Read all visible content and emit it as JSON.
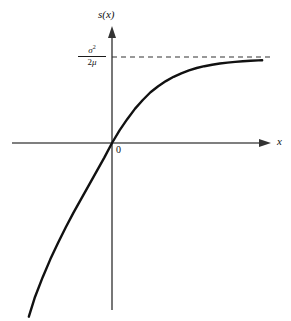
{
  "chart_data": {
    "type": "line",
    "title": "",
    "subtitle": "",
    "xlabel": "x",
    "ylabel": "s(x)",
    "origin_label": "0",
    "grid": false,
    "legend": null,
    "xlim": [
      -1.1,
      2.05
    ],
    "ylim": [
      -2.05,
      1.18
    ],
    "axes": {
      "x_axis_y_value": 0,
      "y_axis_x_value": 0,
      "x_arrow": true,
      "y_arrow": true,
      "x_axis_start": -1.1,
      "x_axis_end": 2.0,
      "y_axis_bottom": -1.95,
      "y_axis_top": 1.15
    },
    "annotations": [
      {
        "name": "asymptote-label",
        "numerator": "σ",
        "numerator_exponent": "2",
        "denominator_coefficient": "2",
        "denominator_symbol": "μ",
        "text": "σ²/2μ",
        "y_value": 1.0
      }
    ],
    "asymptote": {
      "type": "horizontal-dashed",
      "y_value": 1.0,
      "x_from": 0,
      "x_to": 2.05,
      "dash_pattern": "5,4",
      "color": "#333333"
    },
    "series": [
      {
        "name": "s(x)",
        "color": "#111111",
        "line_width": 2.4,
        "dashed": false,
        "x": [
          -1.08,
          -1.0,
          -0.9,
          -0.8,
          -0.7,
          -0.6,
          -0.5,
          -0.4,
          -0.3,
          -0.2,
          -0.1,
          0.0,
          0.1,
          0.2,
          0.3,
          0.4,
          0.5,
          0.6,
          0.7,
          0.8,
          0.9,
          1.0,
          1.1,
          1.2,
          1.3,
          1.4,
          1.5,
          1.6,
          1.7,
          1.8,
          1.9,
          1.95
        ],
        "y": [
          -2.02,
          -1.79,
          -1.56,
          -1.35,
          -1.16,
          -0.98,
          -0.81,
          -0.65,
          -0.49,
          -0.33,
          -0.17,
          0.0,
          0.15,
          0.28,
          0.4,
          0.5,
          0.59,
          0.66,
          0.72,
          0.77,
          0.81,
          0.845,
          0.872,
          0.893,
          0.91,
          0.924,
          0.935,
          0.944,
          0.951,
          0.957,
          0.961,
          0.963
        ]
      }
    ]
  },
  "labels": {
    "y_axis": "s(x)",
    "x_axis": "x",
    "origin": "0",
    "asymptote_numerator_base": "σ",
    "asymptote_numerator_exp": "2",
    "asymptote_denominator_num": "2",
    "asymptote_denominator_sym": "μ"
  },
  "colors": {
    "background": "#ffffff",
    "axis": "#555555",
    "curve": "#111111",
    "asymptote": "#333333",
    "text": "#111111"
  }
}
